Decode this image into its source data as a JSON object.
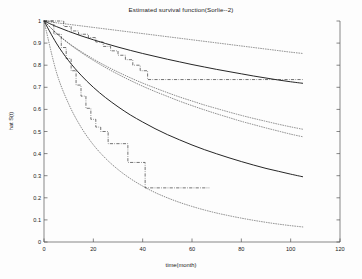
{
  "chart_data": {
    "type": "line",
    "title": "Estimated survival function(Sorlie--2)",
    "xlabel": "time(month)",
    "ylabel": "hat S(t)",
    "xlim": [
      0,
      120
    ],
    "ylim": [
      0,
      1
    ],
    "xticks": [
      0,
      20,
      40,
      60,
      80,
      100,
      120
    ],
    "xtick_labels": [
      "0",
      "20",
      "40",
      "60",
      "80",
      "100",
      "120"
    ],
    "yticks": [
      0,
      0.1,
      0.2,
      0.3,
      0.4,
      0.5,
      0.6,
      0.7,
      0.8,
      0.9,
      1
    ],
    "ytick_labels": [
      "0",
      "0.1",
      "0.2",
      "0.3",
      "0.4",
      "0.5",
      "0.6",
      "0.7",
      "0.8",
      "0.9",
      "1"
    ],
    "grid": false,
    "legend": null,
    "background": "#ffffff",
    "line_color": "#1a1a1a",
    "series": [
      {
        "name": "Group 1 fitted survival (solid)",
        "style": "solid",
        "x": [
          0,
          5,
          10,
          15,
          20,
          25,
          30,
          35,
          40,
          45,
          50,
          55,
          60,
          65,
          70,
          75,
          80,
          85,
          90,
          95,
          100,
          105
        ],
        "values": [
          1.0,
          0.975,
          0.953,
          0.933,
          0.915,
          0.898,
          0.882,
          0.867,
          0.853,
          0.84,
          0.827,
          0.815,
          0.803,
          0.792,
          0.781,
          0.771,
          0.761,
          0.751,
          0.742,
          0.733,
          0.725,
          0.718
        ]
      },
      {
        "name": "Group 1 upper confidence band (dotted)",
        "style": "dotted",
        "x": [
          0,
          5,
          10,
          15,
          20,
          25,
          30,
          35,
          40,
          45,
          50,
          55,
          60,
          65,
          70,
          75,
          80,
          85,
          90,
          95,
          100,
          105
        ],
        "values": [
          1.0,
          0.992,
          0.985,
          0.978,
          0.971,
          0.964,
          0.957,
          0.95,
          0.943,
          0.936,
          0.929,
          0.922,
          0.915,
          0.908,
          0.901,
          0.894,
          0.887,
          0.88,
          0.873,
          0.866,
          0.859,
          0.853
        ]
      },
      {
        "name": "Group 1 lower confidence band (dotted)",
        "style": "dotted",
        "x": [
          0,
          5,
          10,
          15,
          20,
          25,
          30,
          35,
          40,
          45,
          50,
          55,
          60,
          65,
          70,
          75,
          80,
          85,
          90,
          95,
          100,
          105
        ],
        "values": [
          1.0,
          0.945,
          0.9,
          0.862,
          0.828,
          0.797,
          0.769,
          0.743,
          0.719,
          0.697,
          0.676,
          0.656,
          0.638,
          0.62,
          0.604,
          0.588,
          0.573,
          0.559,
          0.546,
          0.533,
          0.521,
          0.51
        ]
      },
      {
        "name": "Group 2 fitted survival (solid)",
        "style": "solid",
        "x": [
          0,
          5,
          10,
          15,
          20,
          25,
          30,
          35,
          40,
          45,
          50,
          55,
          60,
          65,
          70,
          75,
          80,
          85,
          90,
          95,
          100,
          105
        ],
        "values": [
          1.0,
          0.9,
          0.82,
          0.755,
          0.7,
          0.653,
          0.612,
          0.575,
          0.543,
          0.513,
          0.486,
          0.462,
          0.439,
          0.418,
          0.399,
          0.381,
          0.364,
          0.348,
          0.333,
          0.32,
          0.307,
          0.295
        ]
      },
      {
        "name": "Group 2 upper confidence band (dotted)",
        "style": "dotted",
        "x": [
          0,
          5,
          10,
          15,
          20,
          25,
          30,
          35,
          40,
          45,
          50,
          55,
          60,
          65,
          70,
          75,
          80,
          85,
          90,
          95,
          100,
          105
        ],
        "values": [
          1.0,
          0.945,
          0.898,
          0.858,
          0.822,
          0.789,
          0.759,
          0.731,
          0.705,
          0.681,
          0.659,
          0.637,
          0.617,
          0.598,
          0.58,
          0.563,
          0.546,
          0.531,
          0.516,
          0.502,
          0.488,
          0.476
        ]
      },
      {
        "name": "Group 2 lower confidence band (dotted)",
        "style": "dotted",
        "x": [
          0,
          5,
          10,
          15,
          20,
          25,
          30,
          35,
          40,
          45,
          50,
          55,
          60,
          65,
          70,
          75,
          80,
          85,
          90,
          95,
          100,
          105
        ],
        "values": [
          1.0,
          0.77,
          0.625,
          0.52,
          0.44,
          0.378,
          0.328,
          0.287,
          0.253,
          0.224,
          0.2,
          0.179,
          0.161,
          0.145,
          0.131,
          0.119,
          0.108,
          0.098,
          0.089,
          0.081,
          0.074,
          0.068
        ]
      },
      {
        "name": "Group 1 Kaplan-Meier estimate (dash-dot step)",
        "style": "dashdot-step",
        "x": [
          0,
          6,
          8,
          11,
          14,
          18,
          21,
          24,
          27,
          30,
          33,
          36,
          39,
          42,
          105
        ],
        "values": [
          1.0,
          1.0,
          0.975,
          0.955,
          0.94,
          0.925,
          0.905,
          0.885,
          0.865,
          0.845,
          0.825,
          0.8,
          0.775,
          0.735,
          0.735
        ]
      },
      {
        "name": "Group 2 Kaplan-Meier estimate (dash-dot step)",
        "style": "dashdot-step",
        "x": [
          0,
          4,
          7,
          9,
          11,
          13,
          15,
          17,
          19,
          21,
          23,
          26,
          30,
          34,
          41,
          67
        ],
        "values": [
          1.0,
          0.94,
          0.88,
          0.83,
          0.775,
          0.71,
          0.66,
          0.605,
          0.555,
          0.52,
          0.5,
          0.445,
          0.445,
          0.36,
          0.245,
          0.245
        ]
      }
    ]
  }
}
